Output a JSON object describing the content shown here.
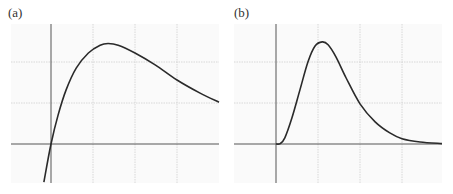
{
  "chart_data": [
    {
      "type": "line",
      "panel_label": "(a)",
      "title": "",
      "xlabel": "",
      "ylabel": "",
      "grid": true,
      "legend": null,
      "description": "Curve rising steeply through the origin, peaking then decaying slowly",
      "axis_lines": {
        "x_axis_y": 0,
        "y_axis_x": 0
      },
      "gridlines_x": [
        0,
        1,
        2,
        3
      ],
      "gridlines_y": [
        0,
        1,
        2
      ],
      "xlim": [
        -0.95,
        4.0
      ],
      "ylim": [
        -0.95,
        2.5
      ],
      "series": [
        {
          "name": "curve-a",
          "x": [
            -0.17,
            0.0,
            0.17,
            0.36,
            0.6,
            0.89,
            1.17,
            1.36,
            1.6,
            2.0,
            2.48,
            3.0,
            3.55,
            4.0
          ],
          "y": [
            -0.93,
            0.0,
            0.71,
            1.32,
            1.85,
            2.22,
            2.41,
            2.45,
            2.41,
            2.22,
            1.93,
            1.56,
            1.24,
            1.02
          ]
        }
      ]
    },
    {
      "type": "line",
      "panel_label": "(b)",
      "title": "",
      "xlabel": "",
      "ylabel": "",
      "grid": true,
      "legend": null,
      "description": "Curve starting flat at zero, rising to a sharp peak then decaying asymptotically to zero",
      "axis_lines": {
        "x_axis_y": 0,
        "y_axis_x": 0
      },
      "gridlines_x": [
        0,
        1,
        2,
        3
      ],
      "gridlines_y": [
        0,
        1,
        2
      ],
      "xlim": [
        -1.0,
        3.95
      ],
      "ylim": [
        -0.95,
        2.5
      ],
      "series": [
        {
          "name": "curve-b",
          "x": [
            0.0,
            0.1,
            0.21,
            0.38,
            0.57,
            0.76,
            0.93,
            1.1,
            1.24,
            1.43,
            1.67,
            2.0,
            2.36,
            2.71,
            3.0,
            3.43,
            3.95
          ],
          "y": [
            0.0,
            0.01,
            0.15,
            0.64,
            1.32,
            2.0,
            2.39,
            2.49,
            2.42,
            2.12,
            1.61,
            0.98,
            0.54,
            0.27,
            0.13,
            0.05,
            0.01
          ]
        }
      ]
    }
  ],
  "panels": [
    {
      "label": "(a)"
    },
    {
      "label": "(b)"
    }
  ]
}
